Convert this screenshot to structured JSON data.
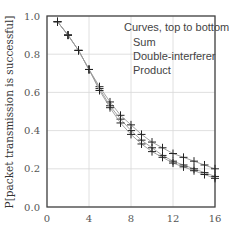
{
  "chart_data": {
    "type": "line",
    "title": "",
    "xlabel": "",
    "ylabel": "P[packet transmission is successful]",
    "xlim": [
      0,
      16
    ],
    "ylim": [
      0.0,
      1.0
    ],
    "x_ticks": [
      "0",
      "4",
      "8",
      "12",
      "16"
    ],
    "y_ticks": [
      "0.0",
      "0.2",
      "0.4",
      "0.6",
      "0.8",
      "1.0"
    ],
    "grid": true,
    "legend": {
      "title": "Curves, top to bottom:",
      "entries": [
        "Sum",
        "Double-interferer",
        "Product"
      ],
      "position": "upper right"
    },
    "x": [
      1,
      2,
      3,
      4,
      5,
      6,
      7,
      8,
      9,
      10,
      11,
      12,
      13,
      14,
      15,
      16
    ],
    "series": [
      {
        "name": "Sum",
        "values": [
          0.97,
          0.9,
          0.82,
          0.72,
          0.63,
          0.55,
          0.48,
          0.43,
          0.38,
          0.34,
          0.31,
          0.28,
          0.26,
          0.24,
          0.22,
          0.2
        ]
      },
      {
        "name": "Double-interferer",
        "values": [
          0.97,
          0.9,
          0.82,
          0.72,
          0.62,
          0.53,
          0.46,
          0.4,
          0.35,
          0.31,
          0.27,
          0.24,
          0.22,
          0.2,
          0.18,
          0.16
        ]
      },
      {
        "name": "Product",
        "values": [
          0.97,
          0.9,
          0.82,
          0.72,
          0.61,
          0.52,
          0.44,
          0.38,
          0.33,
          0.29,
          0.26,
          0.23,
          0.21,
          0.19,
          0.17,
          0.15
        ]
      }
    ],
    "marker": "plus",
    "colors": {
      "line": "#555555",
      "marker": "#222222",
      "grid": "#d8d8d8",
      "axis": "#444444"
    }
  }
}
